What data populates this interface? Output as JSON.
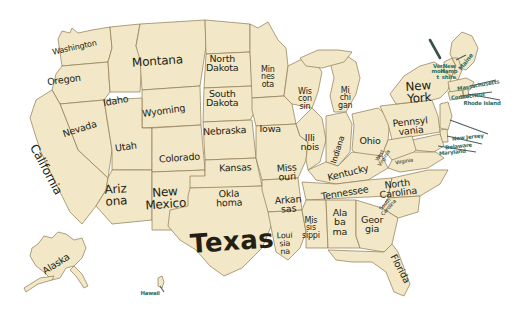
{
  "image": {
    "title": "Map of the United States with state names",
    "width": 518,
    "height": 326,
    "background_color": "#ffffff",
    "land_color": "#f2e7c6",
    "border_color": "#8c7a52",
    "label_color": "#241f14",
    "callout_label_color": "#2f6b63"
  },
  "states": [
    {
      "name": "washington",
      "label": "Washington",
      "x": 74,
      "y": 48,
      "rotate": -12,
      "size": "lbl-sm"
    },
    {
      "name": "oregon",
      "label": "Oregon",
      "x": 64,
      "y": 79,
      "rotate": -8,
      "size": "lbl-md"
    },
    {
      "name": "idaho",
      "label": "Idaho",
      "x": 116,
      "y": 100,
      "rotate": -10,
      "size": "lbl-md"
    },
    {
      "name": "montana",
      "label": "Montana",
      "x": 157,
      "y": 62,
      "rotate": -4,
      "size": "lbl-lg"
    },
    {
      "name": "wyoming",
      "label": "Wyoming",
      "x": 163,
      "y": 110,
      "rotate": -8,
      "size": "lbl-md"
    },
    {
      "name": "north-dakota",
      "label": "North\nDakota",
      "x": 222,
      "y": 63,
      "rotate": 0,
      "size": "lbl-md"
    },
    {
      "name": "south-dakota",
      "label": "South\nDakota",
      "x": 222,
      "y": 98,
      "rotate": 0,
      "size": "lbl-md"
    },
    {
      "name": "nebraska",
      "label": "Nebraska",
      "x": 224,
      "y": 130,
      "rotate": -3,
      "size": "lbl-md"
    },
    {
      "name": "minnesota",
      "label": "Min\nnes\nota",
      "x": 268,
      "y": 77,
      "rotate": 0,
      "size": "lbl-sm"
    },
    {
      "name": "wisconsin",
      "label": "Wis\ncon\nsin",
      "x": 305,
      "y": 99,
      "rotate": 0,
      "size": "lbl-sm"
    },
    {
      "name": "iowa",
      "label": "Iowa",
      "x": 270,
      "y": 128,
      "rotate": 0,
      "size": "lbl-md"
    },
    {
      "name": "michigan",
      "label": "Mi\nchi\ngan",
      "x": 345,
      "y": 98,
      "rotate": 0,
      "size": "lbl-sm"
    },
    {
      "name": "illinois",
      "label": "Illi\nnois",
      "x": 310,
      "y": 142,
      "rotate": 0,
      "size": "lbl-md"
    },
    {
      "name": "indiana",
      "label": "Indiana",
      "x": 338,
      "y": 150,
      "rotate": -72,
      "size": "lbl-sm"
    },
    {
      "name": "ohio",
      "label": "Ohio",
      "x": 370,
      "y": 140,
      "rotate": 0,
      "size": "lbl-md"
    },
    {
      "name": "pennsylvania",
      "label": "Pennsyl\nvania",
      "x": 410,
      "y": 126,
      "rotate": -6,
      "size": "lbl-md"
    },
    {
      "name": "new-york",
      "label": "New\nYork",
      "x": 419,
      "y": 93,
      "rotate": -4,
      "size": "lbl-lg"
    },
    {
      "name": "nevada",
      "label": "Nevada",
      "x": 79,
      "y": 128,
      "rotate": -18,
      "size": "lbl-md"
    },
    {
      "name": "utah",
      "label": "Utah",
      "x": 126,
      "y": 146,
      "rotate": -8,
      "size": "lbl-md"
    },
    {
      "name": "california",
      "label": "California",
      "x": 45,
      "y": 170,
      "rotate": 62,
      "size": "lbl-lg"
    },
    {
      "name": "colorado",
      "label": "Colorado",
      "x": 179,
      "y": 157,
      "rotate": -4,
      "size": "lbl-md"
    },
    {
      "name": "kansas",
      "label": "Kansas",
      "x": 235,
      "y": 167,
      "rotate": -2,
      "size": "lbl-md"
    },
    {
      "name": "missouri",
      "label": "Miss\nouri",
      "x": 287,
      "y": 172,
      "rotate": -4,
      "size": "lbl-md"
    },
    {
      "name": "kentucky",
      "label": "Kentucky",
      "x": 348,
      "y": 172,
      "rotate": -14,
      "size": "lbl-md"
    },
    {
      "name": "arizona",
      "label": "Ariz\nona",
      "x": 116,
      "y": 196,
      "rotate": -4,
      "size": "lbl-lg"
    },
    {
      "name": "new-mexico",
      "label": "New\nMexico",
      "x": 165,
      "y": 199,
      "rotate": -4,
      "size": "lbl-lg"
    },
    {
      "name": "oklahoma",
      "label": "Okla\nhoma",
      "x": 229,
      "y": 198,
      "rotate": -2,
      "size": "lbl-md"
    },
    {
      "name": "arkansas",
      "label": "Arkan\nsas",
      "x": 288,
      "y": 204,
      "rotate": -4,
      "size": "lbl-md"
    },
    {
      "name": "tennessee",
      "label": "Tennessee",
      "x": 345,
      "y": 192,
      "rotate": -9,
      "size": "lbl-md"
    },
    {
      "name": "north-carolina",
      "label": "North\nCarolina",
      "x": 398,
      "y": 188,
      "rotate": -7,
      "size": "lbl-md"
    },
    {
      "name": "south-carolina",
      "label": "South\nCarolina",
      "x": 387,
      "y": 206,
      "rotate": -48,
      "size": "lbl-tiny"
    },
    {
      "name": "virginia",
      "label": "Virginia",
      "x": 404,
      "y": 161,
      "rotate": -10,
      "size": "lbl-tiny"
    },
    {
      "name": "west-virginia",
      "label": "West\nVirginia",
      "x": 382,
      "y": 157,
      "rotate": -58,
      "size": "lbl-tiny"
    },
    {
      "name": "mississippi",
      "label": "Mis\nsis\nsippi",
      "x": 311,
      "y": 228,
      "rotate": 0,
      "size": "lbl-sm"
    },
    {
      "name": "alabama",
      "label": "Ala\nba\nma",
      "x": 340,
      "y": 222,
      "rotate": 0,
      "size": "lbl-md"
    },
    {
      "name": "georgia",
      "label": "Geor\ngia",
      "x": 372,
      "y": 224,
      "rotate": 0,
      "size": "lbl-md"
    },
    {
      "name": "louisiana",
      "label": "Loui\nsia\nna",
      "x": 285,
      "y": 243,
      "rotate": -2,
      "size": "lbl-sm"
    },
    {
      "name": "texas",
      "label": "Texas",
      "x": 232,
      "y": 241,
      "rotate": -4,
      "size": "lbl-xl"
    },
    {
      "name": "florida",
      "label": "Florida",
      "x": 400,
      "y": 268,
      "rotate": 62,
      "size": "lbl-md"
    },
    {
      "name": "alaska",
      "label": "Alaska",
      "x": 56,
      "y": 263,
      "rotate": -32,
      "size": "lbl-md"
    }
  ],
  "callout_states": [
    {
      "name": "maine",
      "label": "Maine",
      "x": 465,
      "y": 62,
      "rotate": -52,
      "size": "lbl-teal-a"
    },
    {
      "name": "vermont",
      "label": "Ver\nmon\nt",
      "x": 438,
      "y": 72,
      "rotate": 0,
      "size": "lbl-teal"
    },
    {
      "name": "new-hampshire",
      "label": "New\nHamp\nshire",
      "x": 449,
      "y": 72,
      "rotate": 0,
      "size": "lbl-teal"
    },
    {
      "name": "massachusetts",
      "label": "Massachusetts",
      "x": 478,
      "y": 85,
      "rotate": -10,
      "size": "lbl-teal"
    },
    {
      "name": "rhode-island",
      "label": "Rhode Island",
      "x": 482,
      "y": 103,
      "rotate": 0,
      "size": "lbl-teal"
    },
    {
      "name": "connecticut",
      "label": "Connecticut",
      "x": 468,
      "y": 96,
      "rotate": -6,
      "size": "lbl-teal"
    },
    {
      "name": "new-jersey",
      "label": "New Jersey",
      "x": 468,
      "y": 137,
      "rotate": -6,
      "size": "lbl-teal"
    },
    {
      "name": "delaware",
      "label": "Delaware",
      "x": 458,
      "y": 146,
      "rotate": -6,
      "size": "lbl-teal"
    },
    {
      "name": "maryland",
      "label": "Maryland",
      "x": 452,
      "y": 152,
      "rotate": -6,
      "size": "lbl-teal"
    },
    {
      "name": "hawaii",
      "label": "Hawaii",
      "x": 150,
      "y": 293,
      "rotate": 0,
      "size": "lbl-teal"
    }
  ]
}
